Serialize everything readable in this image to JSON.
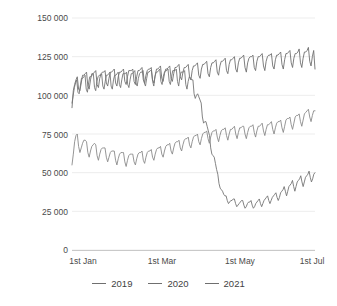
{
  "chart_data": {
    "type": "line",
    "title": "",
    "xlabel": "",
    "ylabel": "Number of commercial flights",
    "ylim": [
      0,
      150000
    ],
    "ytick_labels": [
      "150 000",
      "125 000",
      "100 000",
      "75 000",
      "50 000",
      "25 000",
      "0"
    ],
    "ytick_values": [
      150000,
      125000,
      100000,
      75000,
      50000,
      25000,
      0
    ],
    "xtick_labels": [
      "1st Jan",
      "1st Mar",
      "1st May",
      "1st Jul"
    ],
    "xtick_days": [
      0,
      59,
      120,
      181
    ],
    "x_range_days": [
      0,
      181
    ],
    "grid": "horizontal",
    "legend_position": "bottom-center",
    "legend": [
      "2019",
      "2020",
      "2021"
    ],
    "series": [
      {
        "name": "2019",
        "color": "#6f6f6f",
        "values": [
          92000,
          103000,
          107000,
          110000,
          112000,
          104000,
          103000,
          108000,
          113000,
          113000,
          114000,
          115000,
          106000,
          104000,
          110000,
          114000,
          114000,
          115000,
          116000,
          107000,
          105000,
          111000,
          114000,
          115000,
          115000,
          116000,
          108000,
          106000,
          111000,
          115000,
          115000,
          116000,
          117000,
          108000,
          106000,
          112000,
          115000,
          115000,
          116000,
          117000,
          109000,
          107000,
          112000,
          116000,
          116000,
          116000,
          117000,
          109000,
          107000,
          112000,
          116000,
          116000,
          117000,
          118000,
          110000,
          108000,
          113000,
          116000,
          117000,
          117000,
          118000,
          110000,
          108000,
          113000,
          117000,
          117000,
          118000,
          119000,
          111000,
          109000,
          114000,
          117000,
          117000,
          118000,
          119000,
          111000,
          109000,
          114000,
          118000,
          118000,
          119000,
          120000,
          112000,
          110000,
          115000,
          118000,
          118000,
          119000,
          120000,
          112000,
          110000,
          116000,
          119000,
          119000,
          120000,
          121000,
          113000,
          111000,
          117000,
          120000,
          120000,
          121000,
          122000,
          114000,
          112000,
          118000,
          121000,
          121000,
          122000,
          123000,
          115000,
          113000,
          119000,
          122000,
          122000,
          123000,
          124000,
          116000,
          114000,
          120000,
          123000,
          123000,
          124000,
          125000,
          117000,
          115000,
          121000,
          124000,
          124000,
          125000,
          126000,
          118000,
          115000,
          121000,
          124000,
          125000,
          125000,
          126000,
          118000,
          116000,
          122000,
          125000,
          125000,
          126000,
          127000,
          119000,
          116000,
          122000,
          125000,
          126000,
          126000,
          127000,
          119000,
          117000,
          123000,
          126000,
          126000,
          127000,
          128000,
          120000,
          117000,
          123000,
          127000,
          127000,
          128000,
          129000,
          121000,
          118000,
          124000,
          127000,
          127000,
          128000,
          130000,
          121000,
          118000,
          124000,
          128000,
          128000,
          129000,
          131000,
          122000,
          119000,
          125000,
          129000,
          117000
        ]
      },
      {
        "name": "2020",
        "color": "#757575",
        "values": [
          95000,
          100000,
          105000,
          108000,
          110000,
          102000,
          101000,
          106000,
          111000,
          111000,
          112000,
          113000,
          104000,
          102000,
          108000,
          112000,
          112000,
          113000,
          114000,
          105000,
          103000,
          109000,
          112000,
          113000,
          113000,
          114000,
          106000,
          104000,
          109000,
          113000,
          113000,
          114000,
          115000,
          106000,
          104000,
          110000,
          113000,
          113000,
          114000,
          115000,
          107000,
          105000,
          110000,
          114000,
          114000,
          114000,
          115000,
          107000,
          105000,
          110000,
          114000,
          114000,
          115000,
          116000,
          108000,
          106000,
          111000,
          114000,
          115000,
          115000,
          116000,
          108000,
          106000,
          111000,
          115000,
          115000,
          116000,
          116000,
          109000,
          106000,
          112000,
          115000,
          115000,
          116000,
          117000,
          109000,
          107000,
          112000,
          115000,
          116000,
          116000,
          117000,
          109000,
          107000,
          112000,
          116000,
          116000,
          116000,
          117000,
          109000,
          106000,
          112000,
          115000,
          115000,
          115000,
          116000,
          107000,
          104000,
          109000,
          112000,
          111000,
          110000,
          110000,
          101000,
          98000,
          100000,
          101000,
          99000,
          97000,
          95000,
          86000,
          82000,
          83000,
          83000,
          80000,
          77000,
          74000,
          66000,
          62000,
          61000,
          60000,
          56000,
          52000,
          49000,
          43000,
          40000,
          39000,
          38000,
          36000,
          35000,
          35000,
          32000,
          30000,
          31000,
          32000,
          32000,
          33000,
          33000,
          30000,
          28000,
          29000,
          30000,
          31000,
          32000,
          32000,
          29000,
          27000,
          28000,
          30000,
          31000,
          31000,
          32000,
          29000,
          27000,
          28000,
          30000,
          31000,
          32000,
          33000,
          30000,
          28000,
          30000,
          32000,
          33000,
          34000,
          35000,
          32000,
          30000,
          32000,
          34000,
          35000,
          36000,
          37000,
          34000,
          32000,
          34000,
          37000,
          38000,
          39000,
          41000,
          38000,
          35000,
          38000,
          41000,
          42000,
          43000,
          45000,
          41000,
          38000,
          41000,
          44000,
          45000,
          46000,
          48000,
          44000,
          41000,
          44000,
          47000,
          48000,
          49000,
          51000,
          47000,
          44000,
          46000,
          49000,
          50000
        ]
      },
      {
        "name": "2021",
        "color": "#8a8a8a",
        "values": [
          55000,
          62000,
          70000,
          74000,
          75000,
          67000,
          63000,
          66000,
          69000,
          71000,
          71000,
          70000,
          63000,
          60000,
          64000,
          67000,
          68000,
          69000,
          68000,
          61000,
          58000,
          62000,
          65000,
          66000,
          66000,
          66000,
          60000,
          57000,
          60000,
          63000,
          64000,
          64000,
          64000,
          58000,
          55000,
          59000,
          62000,
          63000,
          63000,
          63000,
          57000,
          54000,
          58000,
          61000,
          62000,
          62000,
          62000,
          57000,
          55000,
          59000,
          62000,
          63000,
          63000,
          64000,
          58000,
          56000,
          60000,
          63000,
          64000,
          64000,
          65000,
          60000,
          58000,
          62000,
          65000,
          66000,
          66000,
          67000,
          62000,
          60000,
          64000,
          67000,
          68000,
          68000,
          69000,
          64000,
          62000,
          66000,
          69000,
          70000,
          70000,
          71000,
          66000,
          64000,
          68000,
          71000,
          72000,
          72000,
          73000,
          68000,
          66000,
          70000,
          73000,
          74000,
          74000,
          75000,
          70000,
          68000,
          72000,
          75000,
          76000,
          76000,
          77000,
          72000,
          69000,
          73000,
          76000,
          77000,
          77000,
          78000,
          73000,
          70000,
          74000,
          77000,
          78000,
          78000,
          79000,
          74000,
          71000,
          75000,
          78000,
          78000,
          79000,
          80000,
          75000,
          72000,
          76000,
          79000,
          79000,
          80000,
          80000,
          75000,
          72000,
          76000,
          79000,
          80000,
          80000,
          81000,
          76000,
          73000,
          77000,
          80000,
          80000,
          81000,
          82000,
          77000,
          74000,
          78000,
          81000,
          81000,
          82000,
          83000,
          78000,
          75000,
          79000,
          82000,
          83000,
          83000,
          84000,
          79000,
          76000,
          80000,
          84000,
          85000,
          85000,
          86000,
          81000,
          78000,
          82000,
          86000,
          87000,
          87000,
          88000,
          83000,
          80000,
          84000,
          88000,
          89000,
          90000,
          91000,
          86000,
          83000,
          87000,
          90000,
          90000
        ]
      }
    ]
  },
  "axes": {
    "y_title": "Number of commercial flights"
  }
}
